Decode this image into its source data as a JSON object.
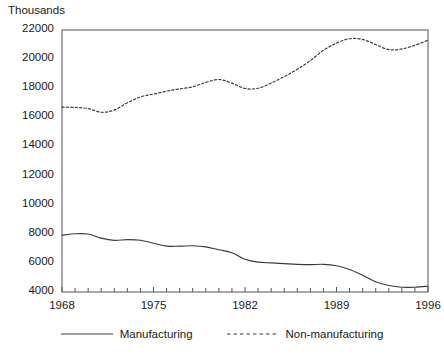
{
  "chart_data": {
    "type": "line",
    "title": "",
    "subtitle": "",
    "ylabel": "Thousands",
    "xlabel": "",
    "ylim": [
      4000,
      22000
    ],
    "xlim": [
      1968,
      1996
    ],
    "grid": false,
    "legend_position": "bottom",
    "y_ticks": [
      4000,
      6000,
      8000,
      10000,
      12000,
      14000,
      16000,
      18000,
      20000,
      22000
    ],
    "y_tick_labels": [
      "4000",
      "6000",
      "8000",
      "10000",
      "12000",
      "14000",
      "16000",
      "18000",
      "20000",
      "22000"
    ],
    "x_ticks": [
      1968,
      1975,
      1982,
      1989,
      1996
    ],
    "x_tick_labels": [
      "1968",
      "1975",
      "1982",
      "1989",
      "1996"
    ],
    "x_minor_tick_step": 1,
    "x": [
      1968,
      1969,
      1970,
      1971,
      1972,
      1973,
      1974,
      1975,
      1976,
      1977,
      1978,
      1979,
      1980,
      1981,
      1982,
      1983,
      1984,
      1985,
      1986,
      1987,
      1988,
      1989,
      1990,
      1991,
      1992,
      1993,
      1994,
      1995,
      1996
    ],
    "series": [
      {
        "name": "Manufacturing",
        "style": "solid",
        "color": "#3b3b3b",
        "values": [
          7900,
          8000,
          7980,
          7700,
          7550,
          7600,
          7560,
          7350,
          7150,
          7150,
          7180,
          7100,
          6900,
          6700,
          6250,
          6050,
          6000,
          5950,
          5900,
          5880,
          5900,
          5800,
          5550,
          5150,
          4700,
          4450,
          4330,
          4330,
          4400
        ]
      },
      {
        "name": "Non-manufacturing",
        "style": "dotted",
        "color": "#3b3b3b",
        "values": [
          16700,
          16680,
          16600,
          16350,
          16500,
          17000,
          17400,
          17600,
          17800,
          17950,
          18100,
          18400,
          18600,
          18350,
          17980,
          18000,
          18350,
          18800,
          19300,
          19900,
          20600,
          21100,
          21400,
          21350,
          21000,
          20650,
          20700,
          20950,
          21300
        ]
      }
    ]
  },
  "legend": {
    "entries": [
      {
        "label": "Manufacturing",
        "style": "solid"
      },
      {
        "label": "Non-manufacturing",
        "style": "dotted"
      }
    ]
  }
}
